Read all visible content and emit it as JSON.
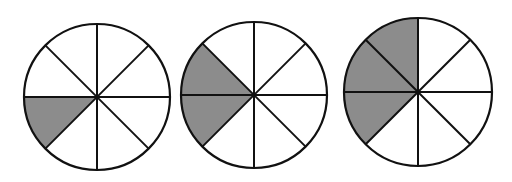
{
  "diagram": {
    "type": "fraction-circles",
    "sectors_per_circle": 8,
    "shade_color": "#8c8c8c",
    "line_color": "#111111",
    "fill_color": "#ffffff",
    "circles": [
      {
        "id": "circle-1",
        "cx": 97,
        "cy": 97,
        "r": 73,
        "shaded_sectors": [
          4
        ],
        "fraction": "1/8"
      },
      {
        "id": "circle-2",
        "cx": 254,
        "cy": 95,
        "r": 73,
        "shaded_sectors": [
          3,
          4
        ],
        "fraction": "2/8"
      },
      {
        "id": "circle-3",
        "cx": 418,
        "cy": 92,
        "r": 74,
        "shaded_sectors": [
          2,
          3,
          4
        ],
        "fraction": "3/8"
      }
    ]
  }
}
